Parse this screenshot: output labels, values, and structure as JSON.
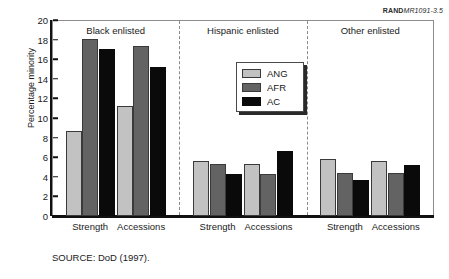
{
  "figure_id": {
    "brand": "RAND",
    "number": "MR1091-3.5"
  },
  "source_note": "SOURCE:  DoD (1997).",
  "legend": {
    "items": [
      {
        "key": "ang",
        "label": "ANG",
        "color": "#c2c2c2"
      },
      {
        "key": "afr",
        "label": "AFR",
        "color": "#636363"
      },
      {
        "key": "ac",
        "label": "AC",
        "color": "#0a0a0a"
      }
    ]
  },
  "panels": [
    {
      "title": "Black enlisted"
    },
    {
      "title": "Hispanic enlisted"
    },
    {
      "title": "Other enlisted"
    }
  ],
  "group_labels": [
    "Strength",
    "Accessions",
    "Strength",
    "Accessions",
    "Strength",
    "Accessions"
  ],
  "chart_data": {
    "type": "bar",
    "title": "",
    "xlabel": "",
    "ylabel": "Percentage minority",
    "ylim": [
      0,
      20
    ],
    "yticks": [
      0,
      2,
      4,
      6,
      8,
      10,
      12,
      14,
      16,
      18,
      20
    ],
    "grid": false,
    "legend_position": "inside-center-top",
    "panels": [
      "Black enlisted",
      "Hispanic enlisted",
      "Other enlisted"
    ],
    "categories": [
      "Black enlisted / Strength",
      "Black enlisted / Accessions",
      "Hispanic enlisted / Strength",
      "Hispanic enlisted / Accessions",
      "Other enlisted / Strength",
      "Other enlisted / Accessions"
    ],
    "series": [
      {
        "name": "ANG",
        "color": "#c2c2c2",
        "values": [
          8.7,
          11.2,
          5.6,
          5.3,
          5.8,
          5.6
        ]
      },
      {
        "name": "AFR",
        "color": "#636363",
        "values": [
          18.1,
          17.3,
          5.3,
          4.3,
          4.4,
          4.4
        ]
      },
      {
        "name": "AC",
        "color": "#0a0a0a",
        "values": [
          17.0,
          15.2,
          4.3,
          6.6,
          3.7,
          5.2
        ]
      }
    ]
  }
}
